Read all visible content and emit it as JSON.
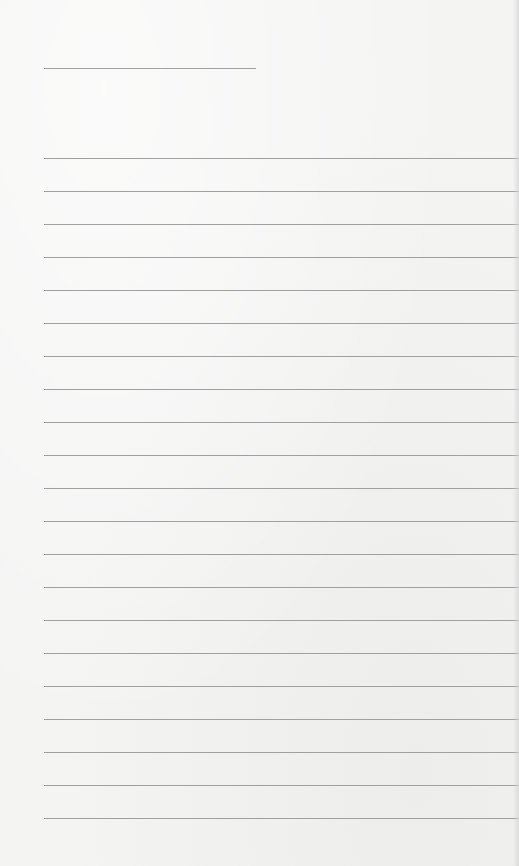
{
  "document": {
    "type": "blank lined writing sheet",
    "title_line": {
      "x": 44,
      "y": 68,
      "width": 212
    },
    "rules": {
      "x": 44,
      "width": 475,
      "positions": [
        158,
        191,
        224,
        257,
        290,
        323,
        356,
        389,
        422,
        455,
        488,
        521,
        554,
        587,
        620,
        653,
        686,
        719,
        752,
        785,
        818
      ]
    },
    "colors": {
      "paper": "#f4f4f3",
      "line": "#a0a0a0"
    }
  }
}
